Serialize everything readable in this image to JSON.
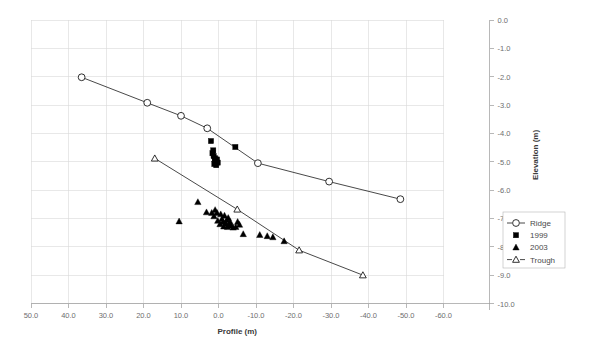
{
  "chart_data": {
    "type": "scatter",
    "title": "",
    "xlabel": "Profile (m)",
    "ylabel": "Elevation (m)",
    "xlim": [
      50.0,
      -60.0
    ],
    "ylim": [
      -10.0,
      0.0
    ],
    "xticks": [
      "50.0",
      "40.0",
      "30.0",
      "20.0",
      "10.0",
      "0.0",
      "-10.0",
      "-20.0",
      "-30.0",
      "-40.0",
      "-50.0",
      "-60.0"
    ],
    "xtick_values": [
      50,
      40,
      30,
      20,
      10,
      0,
      -10,
      -20,
      -30,
      -40,
      -50,
      -60
    ],
    "yticks": [
      "0.0",
      "-1.0",
      "-2.0",
      "-3.0",
      "-4.0",
      "-5.0",
      "-6.0",
      "-7.0",
      "-8.0",
      "-9.0",
      "-10.0"
    ],
    "ytick_values": [
      0,
      -1,
      -2,
      -3,
      -4,
      -5,
      -6,
      -7,
      -8,
      -9,
      -10
    ],
    "grid": true,
    "y_axis_position": "right",
    "legend_position": "right",
    "legend": [
      {
        "label": "Ridge",
        "marker": "open-circle",
        "line": true
      },
      {
        "label": "1999",
        "marker": "filled-square",
        "line": false
      },
      {
        "label": "2003",
        "marker": "filled-triangle",
        "line": false
      },
      {
        "label": "Trough",
        "marker": "open-triangle",
        "line": true
      }
    ],
    "series": [
      {
        "name": "Ridge",
        "marker": "open-circle",
        "line": true,
        "points": [
          [
            36.5,
            -2.02
          ],
          [
            19.0,
            -2.92
          ],
          [
            10.0,
            -3.38
          ],
          [
            3.0,
            -3.82
          ],
          [
            -10.5,
            -5.05
          ],
          [
            -29.5,
            -5.7
          ],
          [
            -48.5,
            -6.32
          ]
        ]
      },
      {
        "name": "Trough",
        "marker": "open-triangle",
        "line": true,
        "points": [
          [
            17.0,
            -4.88
          ],
          [
            -5.0,
            -6.68
          ],
          [
            -21.5,
            -8.12
          ],
          [
            -38.5,
            -9.0
          ]
        ]
      },
      {
        "name": "1999",
        "marker": "filled-square",
        "line": false,
        "points": [
          [
            2.0,
            -4.27
          ],
          [
            -4.5,
            -4.48
          ],
          [
            1.6,
            -4.7
          ],
          [
            1.3,
            -4.8
          ],
          [
            0.9,
            -4.88
          ],
          [
            1.0,
            -4.97
          ],
          [
            0.2,
            -5.03
          ],
          [
            0.6,
            -5.12
          ],
          [
            1.4,
            -4.6
          ],
          [
            0.4,
            -4.92
          ],
          [
            1.1,
            -5.08
          ]
        ]
      },
      {
        "name": "2003",
        "marker": "filled-triangle",
        "line": false,
        "points": [
          [
            5.5,
            -6.42
          ],
          [
            10.5,
            -7.1
          ],
          [
            3.2,
            -6.78
          ],
          [
            1.8,
            -6.8
          ],
          [
            0.9,
            -6.7
          ],
          [
            0.4,
            -6.8
          ],
          [
            -0.6,
            -6.85
          ],
          [
            -1.6,
            -6.9
          ],
          [
            -2.2,
            -7.05
          ],
          [
            -1.2,
            -7.12
          ],
          [
            -2.0,
            -7.18
          ],
          [
            -2.8,
            -7.22
          ],
          [
            -3.4,
            -7.25
          ],
          [
            -2.4,
            -7.3
          ],
          [
            -1.4,
            -7.28
          ],
          [
            -0.4,
            -7.2
          ],
          [
            0.2,
            -7.08
          ],
          [
            -3.9,
            -7.32
          ],
          [
            -4.6,
            -7.3
          ],
          [
            -5.6,
            -7.22
          ],
          [
            -6.6,
            -7.55
          ],
          [
            -11.0,
            -7.58
          ],
          [
            -13.0,
            -7.62
          ],
          [
            -14.5,
            -7.66
          ],
          [
            -17.5,
            -7.8
          ],
          [
            1.2,
            -6.92
          ],
          [
            -0.9,
            -7.02
          ],
          [
            -5.1,
            -7.12
          ],
          [
            -2.6,
            -6.98
          ],
          [
            -3.1,
            -7.12
          ]
        ]
      }
    ]
  }
}
